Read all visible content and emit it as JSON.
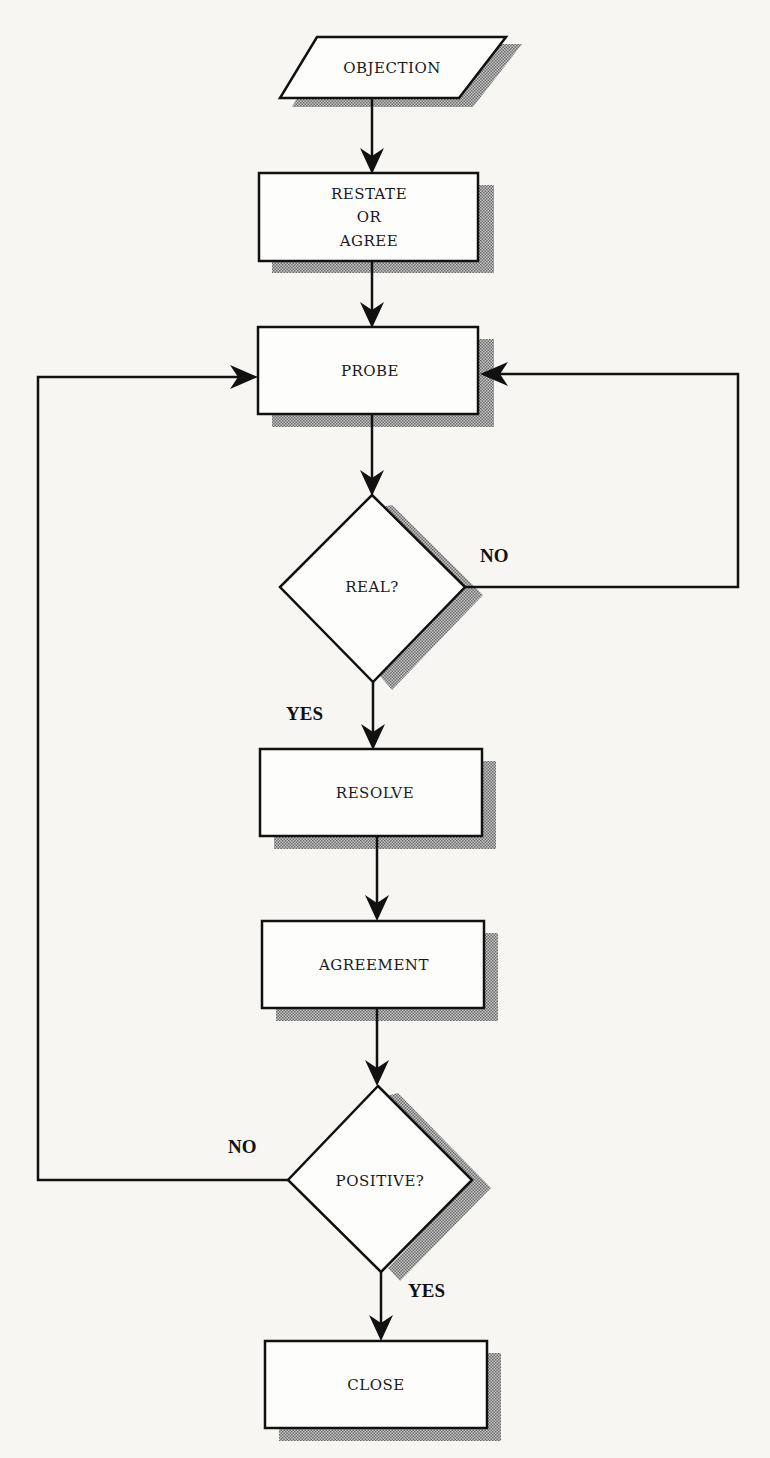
{
  "diagram": {
    "type": "flowchart",
    "nodes": [
      {
        "id": "objection",
        "shape": "parallelogram",
        "label": "OBJECTION"
      },
      {
        "id": "restate",
        "shape": "rectangle",
        "label_lines": [
          "RESTATE",
          "OR",
          "AGREE"
        ]
      },
      {
        "id": "probe",
        "shape": "rectangle",
        "label": "PROBE"
      },
      {
        "id": "real",
        "shape": "diamond",
        "label": "REAL?"
      },
      {
        "id": "resolve",
        "shape": "rectangle",
        "label": "RESOLVE"
      },
      {
        "id": "agreement",
        "shape": "rectangle",
        "label": "AGREEMENT"
      },
      {
        "id": "positive",
        "shape": "diamond",
        "label": "POSITIVE?"
      },
      {
        "id": "close",
        "shape": "rectangle",
        "label": "CLOSE"
      }
    ],
    "edges": [
      {
        "from": "objection",
        "to": "restate",
        "label": ""
      },
      {
        "from": "restate",
        "to": "probe",
        "label": ""
      },
      {
        "from": "probe",
        "to": "real",
        "label": ""
      },
      {
        "from": "real",
        "to": "probe",
        "label": "NO"
      },
      {
        "from": "real",
        "to": "resolve",
        "label": "YES"
      },
      {
        "from": "resolve",
        "to": "agreement",
        "label": ""
      },
      {
        "from": "agreement",
        "to": "positive",
        "label": ""
      },
      {
        "from": "positive",
        "to": "probe",
        "label": "NO"
      },
      {
        "from": "positive",
        "to": "close",
        "label": "YES"
      }
    ],
    "edge_labels": {
      "real_no": "NO",
      "real_yes": "YES",
      "positive_no": "NO",
      "positive_yes": "YES"
    },
    "colors": {
      "stroke": "#111111",
      "fill": "#fdfdfb",
      "shadow": "#8a8a8a",
      "background": "#f7f6f3"
    }
  }
}
